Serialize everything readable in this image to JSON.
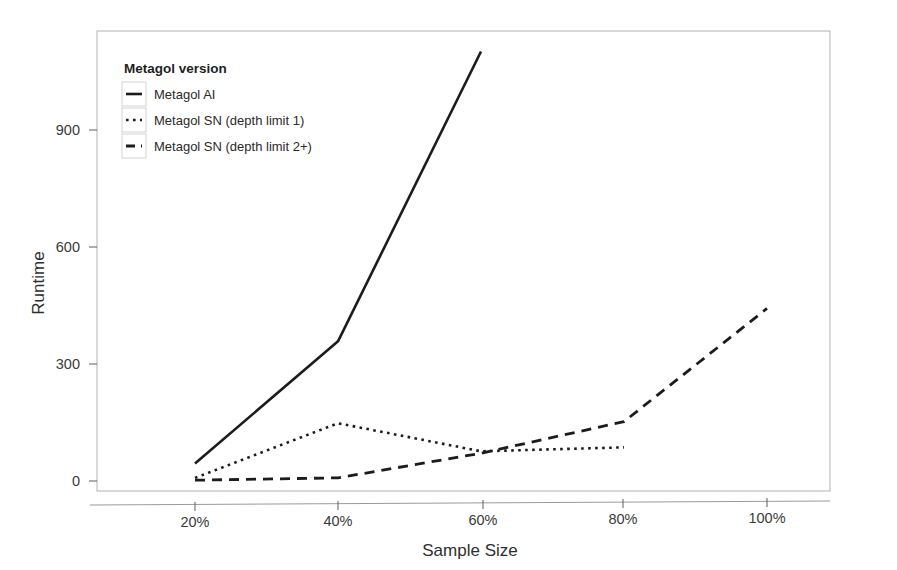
{
  "chart_data": {
    "type": "line",
    "title": "",
    "xlabel": "Sample Size",
    "ylabel": "Runtime",
    "categories": [
      "20%",
      "40%",
      "60%",
      "80%",
      "100%"
    ],
    "x": [
      20,
      40,
      60,
      80,
      100
    ],
    "xlim": [
      10,
      110
    ],
    "ylim": [
      -30,
      1170
    ],
    "yticks": [
      0,
      300,
      600,
      900
    ],
    "ytick_labels": [
      "0",
      "300",
      "600",
      "900"
    ],
    "xtick_labels": [
      "20%",
      "40%",
      "60%",
      "80%",
      "100%"
    ],
    "grid": false,
    "legend_position": "top-left-inside",
    "legend_title": "Metagol version",
    "series": [
      {
        "name": "Metagol AI",
        "style": "solid",
        "x": [
          20,
          40,
          60
        ],
        "values": [
          45,
          360,
          1105
        ]
      },
      {
        "name": "Metagol SN (depth limit 1)",
        "style": "dotted",
        "x": [
          20,
          40,
          60,
          80
        ],
        "values": [
          8,
          150,
          80,
          92
        ]
      },
      {
        "name": "Metagol SN (depth limit 2+)",
        "style": "dashed",
        "x": [
          20,
          40,
          60,
          80,
          100
        ],
        "values": [
          2,
          10,
          75,
          158,
          450
        ]
      }
    ]
  },
  "axes": {
    "y_title": "Runtime",
    "x_title": "Sample Size",
    "y_tick_0": "0",
    "y_tick_1": "300",
    "y_tick_2": "600",
    "y_tick_3": "900",
    "x_tick_0": "20%",
    "x_tick_1": "40%",
    "x_tick_2": "60%",
    "x_tick_3": "80%",
    "x_tick_4": "100%"
  },
  "legend": {
    "title": "Metagol version",
    "items": [
      {
        "label": "Metagol AI",
        "style": "solid"
      },
      {
        "label": "Metagol SN (depth limit 1)",
        "style": "dotted"
      },
      {
        "label": "Metagol SN (depth limit 2+)",
        "style": "dashed"
      }
    ]
  },
  "colors": {
    "series_stroke": "#1c1c1c",
    "panel_border": "#b9b9b9",
    "axis": "#9a9a9a",
    "background": "#ffffff"
  }
}
